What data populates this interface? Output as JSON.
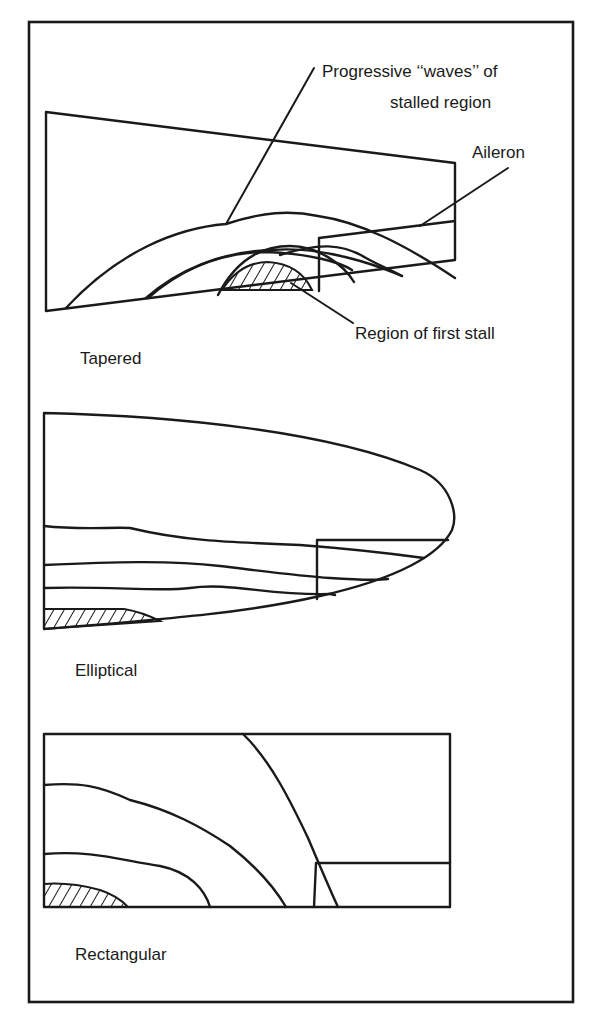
{
  "figure": {
    "panels": [
      {
        "id": "tapered",
        "caption": "Tapered",
        "annotations": {
          "waves": [
            "Progressive ‘‘waves’’ of",
            "stalled region"
          ],
          "aileron": "Aileron",
          "first_stall": "Region of first stall"
        }
      },
      {
        "id": "elliptical",
        "caption": "Elliptical"
      },
      {
        "id": "rectangular",
        "caption": "Rectangular"
      }
    ],
    "colors": {
      "line": "#1a1a1a",
      "background": "#ffffff"
    }
  }
}
